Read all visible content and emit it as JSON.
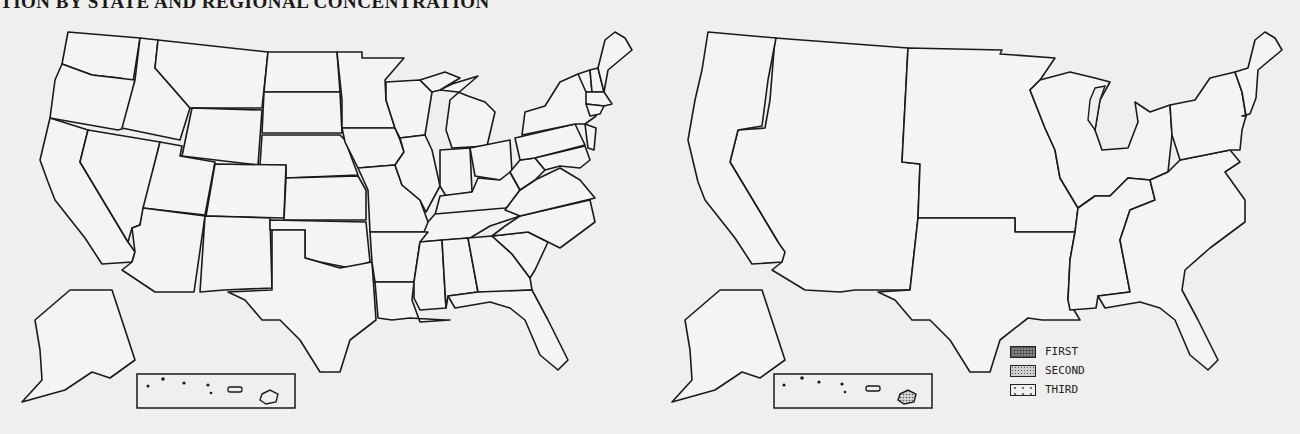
{
  "title": "TION BY STATE AND REGIONAL CONCENTRATION",
  "maps": {
    "left": {
      "description": "States with concentration (shaded)",
      "shaded_states": [
        "California",
        "Nebraska",
        "Minnesota",
        "Iowa",
        "Missouri",
        "Illinois",
        "Michigan",
        "Ohio",
        "Pennsylvania",
        "New York",
        "Massachusetts",
        "Tennessee",
        "Georgia"
      ],
      "shade_color": "#bdbdbd"
    },
    "right": {
      "description": "Regional concentration",
      "regions": [
        {
          "rank": "FIRST",
          "region": "West North Central",
          "states": [
            "Minnesota",
            "Iowa",
            "Missouri",
            "North Dakota",
            "South Dakota",
            "Nebraska",
            "Kansas"
          ],
          "pattern": "dense-grid"
        },
        {
          "rank": "SECOND",
          "region": "Pacific",
          "states": [
            "Washington",
            "Oregon",
            "California",
            "Alaska",
            "Hawaii"
          ],
          "pattern": "fine-dots"
        },
        {
          "rank": "THIRD",
          "region": "East North Central",
          "states": [
            "Wisconsin",
            "Michigan",
            "Illinois",
            "Indiana",
            "Ohio"
          ],
          "pattern": "sparse-dots"
        }
      ]
    }
  },
  "legend": {
    "items": [
      {
        "label": "FIRST"
      },
      {
        "label": "SECOND"
      },
      {
        "label": "THIRD"
      }
    ]
  },
  "colors": {
    "background": "#efefed",
    "outline": "#1a1a1a",
    "first": "#8a8a8a",
    "second": "#cfcfcf",
    "third": "#f0f0ee"
  }
}
